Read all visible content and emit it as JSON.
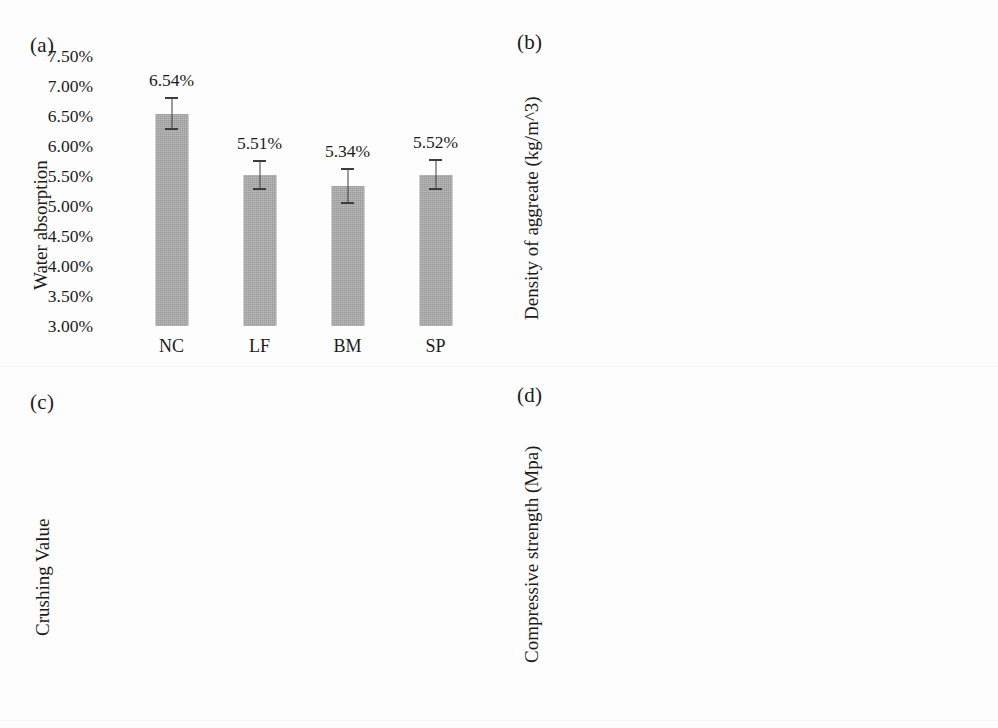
{
  "figure": {
    "background": "#fdfdfd",
    "bar_color_dark": "#a9a9a9",
    "bar_color_light": "#dcdcdc",
    "error_bar_color": "#3d3d3d"
  },
  "panels": {
    "a": {
      "tag": "(a)"
    },
    "b": {
      "tag": "(b)"
    },
    "c": {
      "tag": "(c)"
    },
    "d": {
      "tag": "(d)"
    }
  },
  "chart_data": [
    {
      "panel": "(a)",
      "type": "bar",
      "title": "",
      "xlabel": "",
      "ylabel": "Water absorption",
      "ylim": [
        3.0,
        7.5
      ],
      "ytick_values": [
        7.5,
        7.0,
        6.5,
        6.0,
        5.5,
        5.0,
        4.5,
        4.0,
        3.5,
        3.0
      ],
      "ytick_labels": [
        "7.50%",
        "7.00%",
        "6.50%",
        "6.00%",
        "5.50%",
        "5.00%",
        "4.50%",
        "4.00%",
        "3.50%",
        "3.00%"
      ],
      "grid": false,
      "legend": "none",
      "bar_color": "#a9a9a9",
      "categories": [
        "NC",
        "LF",
        "BM",
        "SP"
      ],
      "values": [
        6.54,
        5.51,
        5.34,
        5.52
      ],
      "value_labels": [
        "6.54%",
        "5.51%",
        "5.34%",
        "5.52%"
      ],
      "errors": [
        0.28,
        0.25,
        0.3,
        0.26
      ]
    },
    {
      "panel": "(b)",
      "type": "bar",
      "title": "",
      "xlabel": "",
      "ylabel": "Density of aggreate (kg/m^3)",
      "ylim": [
        2520,
        2680
      ],
      "ytick_values": [
        2680,
        2660,
        2640,
        2620,
        2600,
        2580,
        2560,
        2540,
        2520
      ],
      "ytick_labels": [
        "2680",
        "2660",
        "2640",
        "2620",
        "2600",
        "2580",
        "2560",
        "2540",
        "2520"
      ],
      "grid": false,
      "legend": "none",
      "bar_color": "#dcdcdc",
      "categories": [
        "NC",
        "LF",
        "BM",
        "SP"
      ],
      "values": [
        2589.1,
        2633.8,
        2641.5,
        2650.0
      ],
      "value_labels": [
        "2589.1",
        "2633.8",
        "2641.5",
        "2650.0"
      ],
      "errors": [
        13.5,
        13.0,
        12.0,
        12.0
      ]
    },
    {
      "panel": "(c)",
      "type": "bar",
      "title": "",
      "xlabel": "",
      "ylabel": "Crushing Value",
      "ylim": [
        0.0,
        30.0
      ],
      "ytick_values": [
        30.0,
        25.0,
        20.0,
        15.0,
        10.0,
        5.0,
        0.0
      ],
      "ytick_labels": [
        "30.0%",
        "25.0%",
        "20.0%",
        "15.0%",
        "10.0%",
        "5.0%",
        "0.0%"
      ],
      "grid": false,
      "legend": "none",
      "bar_color": "#a9a9a9",
      "categories": [
        "NC",
        "BM",
        "LF",
        "SP"
      ],
      "values": [
        25.0,
        26.2,
        25.4,
        25.2
      ],
      "value_labels": [
        "25.0%",
        "26.2%",
        "25.4%",
        "25.2%"
      ],
      "errors": [
        0.25,
        0.2,
        0.22,
        0.25
      ]
    },
    {
      "panel": "(d)",
      "type": "bar",
      "title": "",
      "xlabel": "",
      "ylabel": "Compressive strength (Mpa)",
      "ylim": [
        32.0,
        46.0
      ],
      "ytick_values": [
        46.0,
        44.0,
        42.0,
        40.0,
        38.0,
        36.0,
        34.0,
        32.0
      ],
      "ytick_labels": [
        "46.0",
        "44.0",
        "42.0",
        "40.0",
        "38.0",
        "36.0",
        "34.0",
        "32.0"
      ],
      "grid": false,
      "legend": "none",
      "bar_color": "#a9a9a9",
      "categories": [
        "RC",
        "NC",
        "LF",
        "BM",
        "SP"
      ],
      "values": [
        41.6,
        37.9,
        41.8,
        43.9,
        41.9
      ],
      "value_labels": [
        "41.6",
        "37.9",
        "41.8",
        "43.9",
        "41.9"
      ],
      "errors": [
        1.0,
        1.0,
        0.9,
        0.85,
        0.85
      ]
    }
  ]
}
